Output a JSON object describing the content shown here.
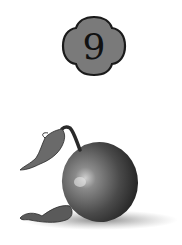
{
  "badge": {
    "number": "9",
    "fill": "#7a7a7a",
    "stroke": "#1a1a1a"
  },
  "illustration": {
    "subject": "round fruit with curled stem and dried leaves",
    "style": "grayscale pencil drawing"
  }
}
